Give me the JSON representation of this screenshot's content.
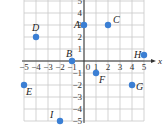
{
  "chart_data": {
    "type": "scatter",
    "title": "",
    "xlabel": "x",
    "ylabel": "",
    "xlim": [
      -5,
      5
    ],
    "ylim": [
      -5,
      5
    ],
    "grid": true,
    "x_ticks": [
      -5,
      -4,
      -3,
      -2,
      -1,
      0,
      1,
      2,
      3,
      4,
      5
    ],
    "y_ticks": [
      -5,
      -4,
      -3,
      -2,
      -1,
      1,
      2,
      3,
      4,
      5
    ],
    "point_color": "#3b7fd4",
    "grid_color": "#c8c8c8",
    "axis_color": "#333333",
    "points": [
      {
        "label": "A",
        "x": 0,
        "y": 3
      },
      {
        "label": "B",
        "x": -1,
        "y": 0
      },
      {
        "label": "C",
        "x": 2,
        "y": 3
      },
      {
        "label": "D",
        "x": -4,
        "y": 2
      },
      {
        "label": "E",
        "x": -5,
        "y": -2
      },
      {
        "label": "F",
        "x": 1,
        "y": -1
      },
      {
        "label": "G",
        "x": 4,
        "y": -2
      },
      {
        "label": "H",
        "x": 5,
        "y": 0.5
      },
      {
        "label": "I",
        "x": -2,
        "y": -5
      }
    ]
  }
}
